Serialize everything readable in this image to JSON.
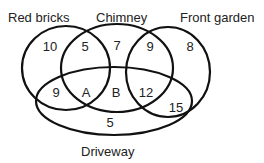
{
  "diagram": {
    "type": "venn",
    "sets": {
      "red_bricks": "Red bricks",
      "chimney": "Chimney",
      "front_garden": "Front garden",
      "driveway": "Driveway"
    },
    "regions": {
      "red_bricks_only": "10",
      "red_bricks_chimney": "5",
      "chimney_only": "7",
      "chimney_front_garden": "9",
      "front_garden_only": "8",
      "red_bricks_driveway": "9",
      "red_bricks_chimney_driveway": "A",
      "chimney_driveway": "B",
      "chimney_front_garden_driveway": "12",
      "front_garden_driveway": "15",
      "driveway_only": "5"
    },
    "stroke_color": "#111111"
  }
}
